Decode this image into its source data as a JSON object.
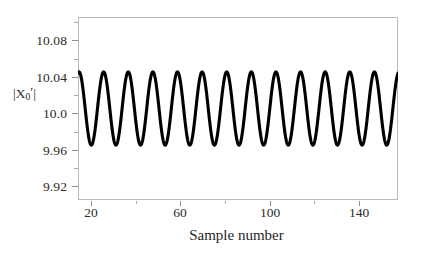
{
  "chart_data": {
    "type": "line",
    "title": "",
    "subtitle": "",
    "xlabel": "Sample number",
    "ylabel": "|X₀′|",
    "ylabel_parts": {
      "prefix": "|X",
      "subscript": "0",
      "prime": "′",
      "suffix": "|"
    },
    "xlim": [
      14,
      157
    ],
    "ylim": [
      9.9,
      10.1
    ],
    "grid": false,
    "legend": null,
    "y_ticks": [
      {
        "value": 10.08,
        "label": "10.08"
      },
      {
        "value": 10.04,
        "label": "10.04"
      },
      {
        "value": 10.0,
        "label": "10.0"
      },
      {
        "value": 9.96,
        "label": "9.96"
      },
      {
        "value": 9.92,
        "label": "9.92"
      }
    ],
    "y_minor_ticks": [
      10.1,
      10.06,
      10.02,
      9.98,
      9.94,
      9.9
    ],
    "x_ticks": [
      {
        "value": 20,
        "label": "20"
      },
      {
        "value": 60,
        "label": "60"
      },
      {
        "value": 100,
        "label": "100"
      },
      {
        "value": 140,
        "label": "140"
      }
    ],
    "x_minor_ticks": [
      40,
      80,
      120
    ],
    "series": [
      {
        "name": "|X0'|",
        "color": "#000000",
        "line_width": 3.1,
        "description": "Steady sinusoidal oscillation, 13 full cycles across the plotted sample range",
        "waveform": {
          "shape": "sine",
          "mean": 10.0,
          "amplitude": 0.04,
          "min": 9.96,
          "max": 10.04,
          "period_samples": 11.0,
          "cycles": 13,
          "phase_deg": 75,
          "start_value": 10.012,
          "end_value": 9.972
        },
        "x": [
          14,
          157
        ],
        "peaks_y": [
          10.04,
          10.04,
          10.04,
          10.04,
          10.04,
          10.04,
          10.04,
          10.04,
          10.04,
          10.04,
          10.04,
          10.04,
          10.04
        ],
        "troughs_y": [
          9.96,
          9.96,
          9.96,
          9.96,
          9.96,
          9.96,
          9.96,
          9.96,
          9.96,
          9.96,
          9.96,
          9.96,
          9.96
        ]
      }
    ]
  },
  "colors": {
    "background": "#ffffff",
    "curve": "#000000",
    "frame": "#b9b9b9",
    "tick": "#8d8d8d",
    "minor_tick": "#a9a9a9",
    "text": "#2b2b2b"
  }
}
